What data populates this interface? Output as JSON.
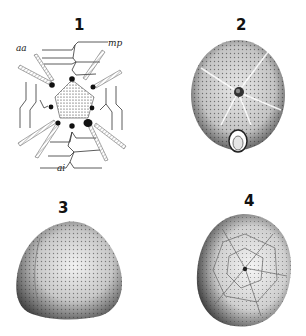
{
  "plate": {
    "figures": [
      {
        "number": "1",
        "description": "apical system diagram",
        "labels": {
          "top_left": "aa",
          "top_right": "mp",
          "bottom": "ai"
        }
      },
      {
        "number": "2",
        "description": "oral view of test with peristome and periproct"
      },
      {
        "number": "3",
        "description": "lateral view of test"
      },
      {
        "number": "4",
        "description": "aboral view of test with plate sutures"
      }
    ],
    "colors": {
      "ink": "#1a1a1a",
      "paper": "#ffffff",
      "shade": "#555555"
    }
  }
}
